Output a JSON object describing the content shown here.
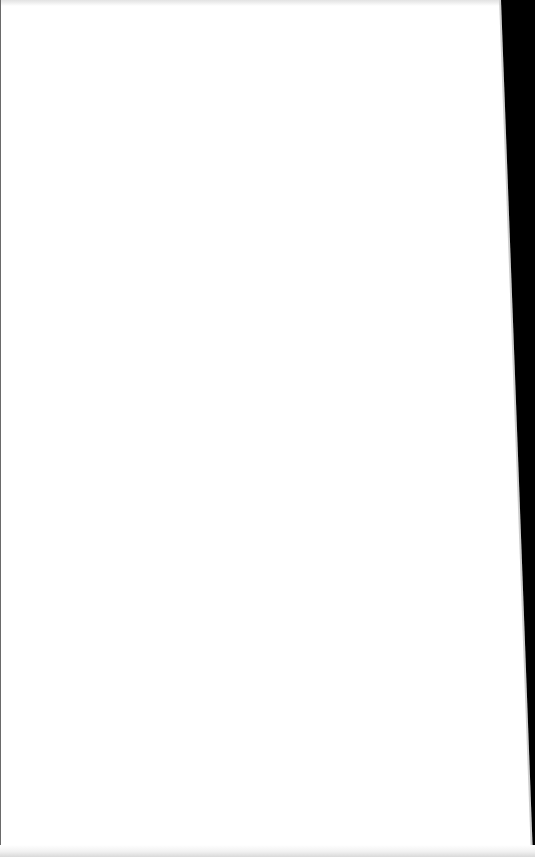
{
  "page": {
    "state": "blank",
    "title": "",
    "content_text": ""
  },
  "colors": {
    "background": "#ffffff",
    "right_edge_strip": "#000000",
    "top_band": "#e2e2e2",
    "bottom_band": "#d9d9d9"
  }
}
